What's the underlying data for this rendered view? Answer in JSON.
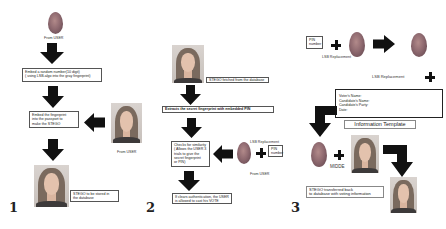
{
  "panels": [
    {
      "number": "1",
      "from_user_top": "From USER",
      "embed_pin_box": [
        "Embed a random number(10 digit)",
        "( using LSB-algo into the gray fingerprint)"
      ],
      "embed_fp_box": [
        "Embed the fingerprint",
        "into the passport to",
        "make the STEGO"
      ],
      "from_user_right": "From USER",
      "stego_box": [
        "STEGO to be stored in",
        "the database"
      ]
    },
    {
      "number": "2",
      "fetched_box": "STEGO fetched from the database",
      "extract_box": "Extracts the secret fingerprint with embedded PIN",
      "check_box": [
        "Checks for similarity",
        "( Allows the USER 3",
        "trials to give the",
        "secret fingerprint",
        "or PIN)"
      ],
      "lsb_label": "LSB Replacement",
      "pin_box": [
        "PIN",
        "number"
      ],
      "from_user": "From USER",
      "result_box": [
        "If clears authentication, the USER",
        "is allowed to cast his VOTE"
      ]
    },
    {
      "number": "3",
      "pin_box": [
        "PIN",
        "number"
      ],
      "lsb_label_1": "LSB Replacement",
      "lsb_label_2": "LSB Replacement",
      "template_fields": [
        "Voter's Name:",
        "Candidate's Name:",
        "Candidate's Party:",
        "Date:"
      ],
      "template_title": "Information Template",
      "midde_label": "MIDDE",
      "final_box": [
        "STEGO transferred back",
        "to database with voting information"
      ]
    }
  ],
  "colors": {
    "arrow": "#111111",
    "box_border": "#555555",
    "fingerprint": "#8f6a70"
  }
}
